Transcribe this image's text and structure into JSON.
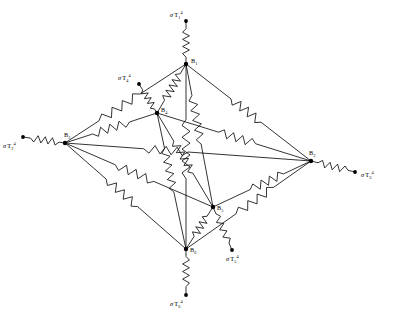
{
  "figure": {
    "type": "radiation-resistance-network",
    "width": 394,
    "height": 316,
    "background_color": "#ffffff",
    "line_color": "#000000"
  },
  "nodes": [
    {
      "id": "B1",
      "label": "B",
      "sub": "1",
      "x": 186,
      "y": 64,
      "label_dx": 5,
      "label_dy": -1
    },
    {
      "id": "B2",
      "label": "B",
      "sub": "2",
      "x": 65,
      "y": 143,
      "label_dx": -1,
      "label_dy": -6
    },
    {
      "id": "B3",
      "label": "B",
      "sub": "3",
      "x": 311,
      "y": 161,
      "label_dx": -2,
      "label_dy": -6
    },
    {
      "id": "B4",
      "label": "B",
      "sub": "4",
      "x": 157,
      "y": 113,
      "label_dx": 4,
      "label_dy": -1
    },
    {
      "id": "B5",
      "label": "B",
      "sub": "5",
      "x": 213,
      "y": 207,
      "label_dx": 4,
      "label_dy": 3
    },
    {
      "id": "B6",
      "label": "B",
      "sub": "6",
      "x": 186,
      "y": 249,
      "label_dx": 4,
      "label_dy": 3
    }
  ],
  "sources": [
    {
      "id": "T1",
      "sigma": "σ",
      "base": "T",
      "sub": "1",
      "sup": "4",
      "x": 186,
      "y": 21,
      "node": "B1",
      "label_dx": -16,
      "label_dy": -4
    },
    {
      "id": "T2",
      "sigma": "σ",
      "base": "T",
      "sub": "2",
      "sup": "4",
      "x": 23,
      "y": 137,
      "node": "B2",
      "label_dx": -20,
      "label_dy": 11
    },
    {
      "id": "T3",
      "sigma": "σ",
      "base": "T",
      "sub": "3",
      "sup": "4",
      "x": 355,
      "y": 172,
      "node": "B3",
      "label_dx": 6,
      "label_dy": 5
    },
    {
      "id": "T4",
      "sigma": "σ",
      "base": "T",
      "sub": "4",
      "sup": "4",
      "x": 139,
      "y": 84,
      "node": "B4",
      "label_dx": -21,
      "label_dy": -4
    },
    {
      "id": "T5",
      "sigma": "σ",
      "base": "T",
      "sub": "5",
      "sup": "4",
      "x": 232,
      "y": 250,
      "node": "B5",
      "label_dx": -6,
      "label_dy": 11
    },
    {
      "id": "T6",
      "sigma": "σ",
      "base": "T",
      "sub": "6",
      "sup": "4",
      "x": 186,
      "y": 295,
      "node": "B6",
      "label_dx": -16,
      "label_dy": 11
    }
  ],
  "surface_resistors": [
    {
      "id": "R-T1-B1",
      "from": "T1",
      "to": "B1",
      "zig_start": 0.18,
      "zig_end": 0.84,
      "zigs": 4,
      "amp": 3.4
    },
    {
      "id": "R-T2-B2",
      "from": "T2",
      "to": "B2",
      "zig_start": 0.18,
      "zig_end": 0.86,
      "zigs": 4,
      "amp": 3.4
    },
    {
      "id": "R-T3-B3",
      "from": "T3",
      "to": "B3",
      "zig_start": 0.16,
      "zig_end": 0.84,
      "zigs": 4,
      "amp": 3.4
    },
    {
      "id": "R-T4-B4",
      "from": "T4",
      "to": "B4",
      "zig_start": 0.2,
      "zig_end": 0.86,
      "zigs": 4,
      "amp": 3.2
    },
    {
      "id": "R-T5-B5",
      "from": "T5",
      "to": "B5",
      "zig_start": 0.16,
      "zig_end": 0.84,
      "zigs": 4,
      "amp": 3.2
    },
    {
      "id": "R-T6-B6",
      "from": "T6",
      "to": "B6",
      "zig_start": 0.18,
      "zig_end": 0.84,
      "zigs": 4,
      "amp": 3.4
    }
  ],
  "space_resistors": [
    {
      "id": "R12",
      "from": "B1",
      "to": "B2",
      "zig_start": 0.38,
      "zig_end": 0.72,
      "zigs": 4,
      "amp": 4.2
    },
    {
      "id": "R13",
      "from": "B1",
      "to": "B3",
      "zig_start": 0.36,
      "zig_end": 0.6,
      "zigs": 4,
      "amp": 4.2
    },
    {
      "id": "R14",
      "from": "B1",
      "to": "B4",
      "zig_start": 0.2,
      "zig_end": 0.74,
      "zigs": 5,
      "amp": 4.0
    },
    {
      "id": "R15",
      "from": "B1",
      "to": "B5",
      "zig_start": 0.22,
      "zig_end": 0.56,
      "zigs": 5,
      "amp": 4.0
    },
    {
      "id": "R16",
      "from": "B1",
      "to": "B6",
      "zig_start": 0.3,
      "zig_end": 0.62,
      "zigs": 5,
      "amp": 4.0
    },
    {
      "id": "R23",
      "from": "B2",
      "to": "B3",
      "zig_start": 0.32,
      "zig_end": 0.5,
      "zigs": 4,
      "amp": 4.0
    },
    {
      "id": "R24",
      "from": "B2",
      "to": "B4",
      "zig_start": 0.3,
      "zig_end": 0.7,
      "zigs": 4,
      "amp": 4.0
    },
    {
      "id": "R25",
      "from": "B2",
      "to": "B5",
      "zig_start": 0.34,
      "zig_end": 0.6,
      "zigs": 4,
      "amp": 4.0
    },
    {
      "id": "R26",
      "from": "B2",
      "to": "B6",
      "zig_start": 0.34,
      "zig_end": 0.6,
      "zigs": 4,
      "amp": 4.0
    },
    {
      "id": "R34",
      "from": "B3",
      "to": "B4",
      "zig_start": 0.36,
      "zig_end": 0.6,
      "zigs": 4,
      "amp": 4.0
    },
    {
      "id": "R35",
      "from": "B3",
      "to": "B5",
      "zig_start": 0.28,
      "zig_end": 0.62,
      "zigs": 4,
      "amp": 4.0
    },
    {
      "id": "R36",
      "from": "B3",
      "to": "B6",
      "zig_start": 0.3,
      "zig_end": 0.6,
      "zigs": 4,
      "amp": 4.0
    },
    {
      "id": "R45",
      "from": "B4",
      "to": "B5",
      "zig_start": 0.3,
      "zig_end": 0.64,
      "zigs": 5,
      "amp": 3.8
    },
    {
      "id": "R46",
      "from": "B4",
      "to": "B6",
      "zig_start": 0.26,
      "zig_end": 0.58,
      "zigs": 5,
      "amp": 3.8
    },
    {
      "id": "R56",
      "from": "B5",
      "to": "B6",
      "zig_start": 0.22,
      "zig_end": 0.7,
      "zigs": 4,
      "amp": 3.8
    }
  ]
}
